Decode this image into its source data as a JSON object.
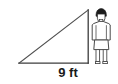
{
  "diagram": {
    "type": "right-triangle-with-human-figure",
    "title": "",
    "background_color": "#ffffff",
    "stroke_color": "#3c3c3c",
    "labels": {
      "base_length": "9 ft"
    },
    "triangle": {
      "vertex_left": {
        "x": 19,
        "y": 63
      },
      "vertex_bottom_right": {
        "x": 88,
        "y": 63
      },
      "vertex_top_right": {
        "x": 88,
        "y": 10
      },
      "right_angle_at": "bottom-right",
      "base_label": "9 ft",
      "fill": "none"
    },
    "person": {
      "description": "standing human figure",
      "outline_color": "#4a4a4a",
      "hair_color": "#1c1c1c",
      "body_fill": "#ffffff",
      "position": {
        "x": 89,
        "y": 7,
        "width": 27,
        "height": 58
      }
    }
  }
}
